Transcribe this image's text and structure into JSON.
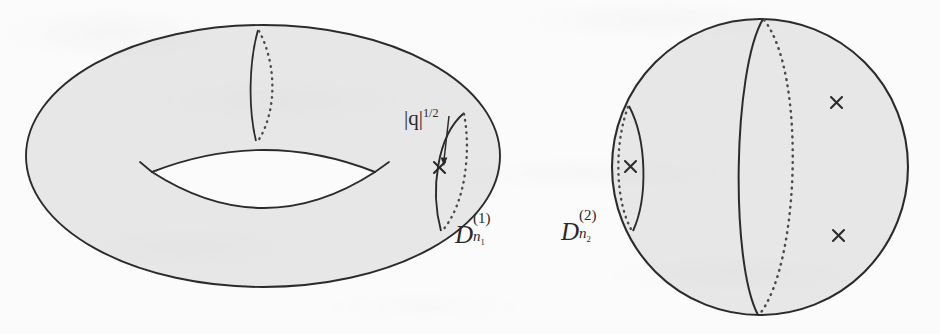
{
  "figure": {
    "kind": "mathematical-illustration",
    "background_color": "#fbfbfb",
    "surface_fill": "#e7e7e7",
    "stroke_color": "#2b2b2b",
    "dotted_stroke_color": "#4a4a4a"
  },
  "labels": {
    "q_norm": {
      "text": "|q|^{1/2}",
      "base": "|q|",
      "exponent": "1/2"
    },
    "disc_one": {
      "text": "D_{n_1}^{(1)}",
      "base": "D",
      "superscript": "(1)",
      "subscript": "n",
      "subscript_index": "1"
    },
    "disc_two": {
      "text": "D_{n_2}^{(2)}",
      "base": "D",
      "superscript": "(2)",
      "subscript": "n",
      "subscript_index": "2"
    }
  },
  "markers": {
    "cross_glyph": "×",
    "positions": [
      {
        "name": "torus-lune-cross",
        "x": 440,
        "y": 168
      },
      {
        "name": "sphere-lune-cross",
        "x": 630,
        "y": 167
      },
      {
        "name": "sphere-upper-cross",
        "x": 836,
        "y": 102
      },
      {
        "name": "sphere-lower-cross",
        "x": 838,
        "y": 235
      }
    ]
  },
  "shapes": {
    "torus": {
      "outer_ellipse": {
        "cx": 263,
        "cy": 156,
        "rx": 237,
        "ry": 131
      },
      "hole_lens": {
        "left_x": 152,
        "right_x": 375,
        "top_y": 136,
        "bottom_y": 222
      },
      "lune_top": {
        "x": 258,
        "y_top": 30,
        "y_bottom": 141
      },
      "lune_right": {
        "x_left": 432,
        "x_right": 466,
        "y_top": 112,
        "y_bottom": 231
      }
    },
    "sphere": {
      "circle": {
        "cx": 760,
        "cy": 167,
        "r": 148
      },
      "meridian_solid_x": 763,
      "meridian_dotted_offset": 42,
      "lune_left": {
        "x_left": 617,
        "x_right": 645,
        "y_top": 105,
        "y_bottom": 232
      }
    }
  }
}
